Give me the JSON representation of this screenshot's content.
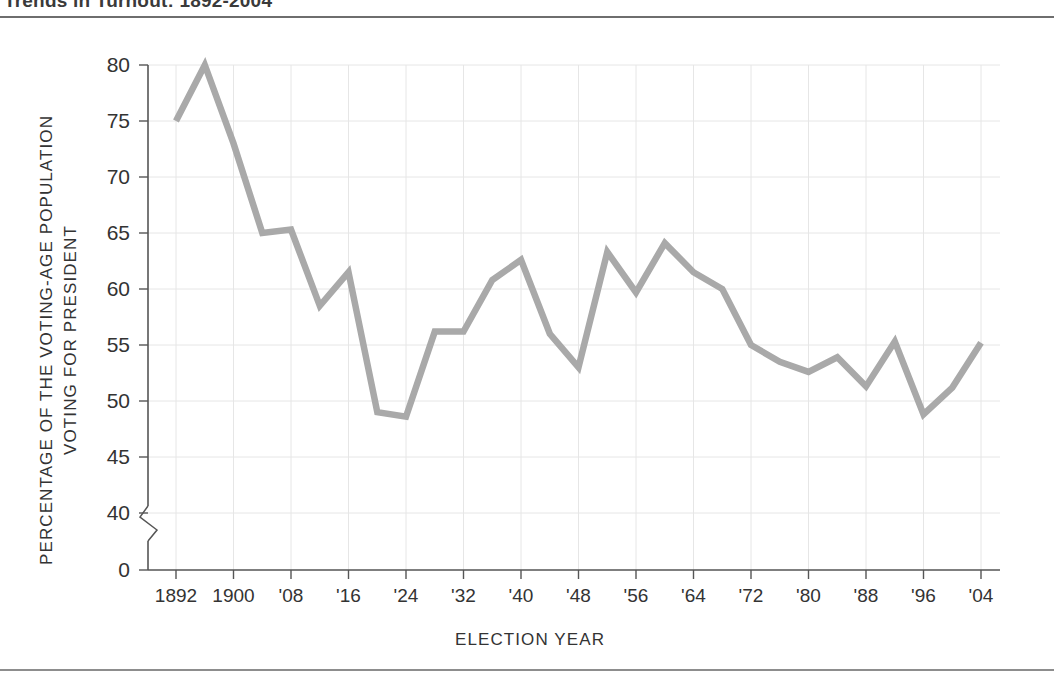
{
  "header": {
    "title": "Trends in Turnout: 1892-2004",
    "title_clipped": true
  },
  "figure": {
    "y_axis_title_line1": "PERCENTAGE OF THE VOTING-AGE POPULATION",
    "y_axis_title_line2": "VOTING FOR PRESIDENT",
    "x_axis_title": "ELECTION YEAR",
    "axis_break": true
  },
  "chart_data": {
    "type": "line",
    "title": "Trends in Turnout: 1892-2004",
    "xlabel": "ELECTION YEAR",
    "ylabel": "PERCENTAGE OF THE VOTING-AGE POPULATION VOTING FOR PRESIDENT",
    "grid": true,
    "legend": "none",
    "line_color": "#a9a9a9",
    "xlim": [
      1888,
      2008
    ],
    "ylim": [
      40,
      80
    ],
    "y_axis_has_break": true,
    "y_break_between": [
      0,
      40
    ],
    "yticks": [
      0,
      40,
      45,
      50,
      55,
      60,
      65,
      70,
      75,
      80
    ],
    "ytick_labels": [
      "0",
      "40",
      "45",
      "50",
      "55",
      "60",
      "65",
      "70",
      "75",
      "80"
    ],
    "xticks": [
      1892,
      1900,
      1908,
      1916,
      1924,
      1932,
      1940,
      1948,
      1956,
      1964,
      1972,
      1980,
      1988,
      1996,
      2004
    ],
    "xtick_labels": [
      "1892",
      "1900",
      "'08",
      "'16",
      "'24",
      "'32",
      "'40",
      "'48",
      "'56",
      "'64",
      "'72",
      "'80",
      "'88",
      "'96",
      "'04"
    ],
    "x": [
      1892,
      1896,
      1900,
      1904,
      1908,
      1912,
      1916,
      1920,
      1924,
      1928,
      1932,
      1936,
      1940,
      1944,
      1948,
      1952,
      1956,
      1960,
      1964,
      1968,
      1972,
      1976,
      1980,
      1984,
      1988,
      1992,
      1996,
      2000,
      2004
    ],
    "values": [
      75.0,
      80.0,
      73.0,
      65.0,
      65.3,
      58.5,
      61.5,
      49.0,
      48.6,
      56.2,
      56.2,
      60.8,
      62.6,
      56.0,
      53.0,
      63.3,
      59.7,
      64.1,
      61.5,
      60.0,
      55.0,
      53.5,
      52.6,
      53.9,
      51.3,
      55.3,
      48.8,
      51.2,
      55.2
    ],
    "series": [
      {
        "name": "Voter turnout",
        "points": [
          {
            "year": 1892,
            "label": "1892",
            "value": 75.0
          },
          {
            "year": 1896,
            "label": "1896",
            "value": 80.0
          },
          {
            "year": 1900,
            "label": "1900",
            "value": 73.0
          },
          {
            "year": 1904,
            "label": "1904",
            "value": 65.0
          },
          {
            "year": 1908,
            "label": "'08",
            "value": 65.3
          },
          {
            "year": 1912,
            "label": "1912",
            "value": 58.5
          },
          {
            "year": 1916,
            "label": "'16",
            "value": 61.5
          },
          {
            "year": 1920,
            "label": "1920",
            "value": 49.0
          },
          {
            "year": 1924,
            "label": "'24",
            "value": 48.6
          },
          {
            "year": 1928,
            "label": "1928",
            "value": 56.2
          },
          {
            "year": 1932,
            "label": "'32",
            "value": 56.2
          },
          {
            "year": 1936,
            "label": "1936",
            "value": 60.8
          },
          {
            "year": 1940,
            "label": "'40",
            "value": 62.6
          },
          {
            "year": 1944,
            "label": "1944",
            "value": 56.0
          },
          {
            "year": 1948,
            "label": "'48",
            "value": 53.0
          },
          {
            "year": 1952,
            "label": "1952",
            "value": 63.3
          },
          {
            "year": 1956,
            "label": "'56",
            "value": 59.7
          },
          {
            "year": 1960,
            "label": "1960",
            "value": 64.1
          },
          {
            "year": 1964,
            "label": "'64",
            "value": 61.5
          },
          {
            "year": 1968,
            "label": "1968",
            "value": 60.0
          },
          {
            "year": 1972,
            "label": "'72",
            "value": 55.0
          },
          {
            "year": 1976,
            "label": "1976",
            "value": 53.5
          },
          {
            "year": 1980,
            "label": "'80",
            "value": 52.6
          },
          {
            "year": 1984,
            "label": "1984",
            "value": 53.9
          },
          {
            "year": 1988,
            "label": "'88",
            "value": 51.3
          },
          {
            "year": 1992,
            "label": "1992",
            "value": 55.3
          },
          {
            "year": 1996,
            "label": "'96",
            "value": 48.8
          },
          {
            "year": 2000,
            "label": "2000",
            "value": 51.2
          },
          {
            "year": 2004,
            "label": "'04",
            "value": 55.2
          }
        ]
      }
    ]
  }
}
